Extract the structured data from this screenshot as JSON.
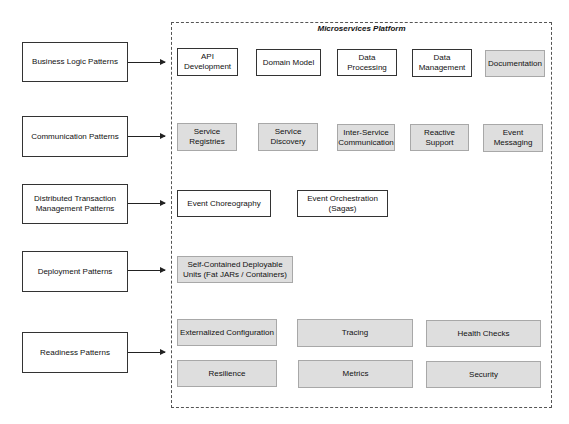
{
  "platform": {
    "title": "Microservices Platform"
  },
  "categories": [
    {
      "label": "Business Logic Patterns"
    },
    {
      "label": "Communication Patterns"
    },
    {
      "label": "Distributed Transaction\nManagement Patterns"
    },
    {
      "label": "Deployment Patterns"
    },
    {
      "label": "Readiness Patterns"
    }
  ],
  "business_logic": [
    {
      "label": "API\nDevelopment",
      "style": "white"
    },
    {
      "label": "Domain Model",
      "style": "white"
    },
    {
      "label": "Data\nProcessing",
      "style": "white"
    },
    {
      "label": "Data\nManagement",
      "style": "white"
    },
    {
      "label": "Documentation",
      "style": "gray"
    }
  ],
  "communication": [
    {
      "label": "Service\nRegistries",
      "style": "gray"
    },
    {
      "label": "Service\nDiscovery",
      "style": "gray"
    },
    {
      "label": "Inter-Service\nCommunication",
      "style": "gray"
    },
    {
      "label": "Reactive\nSupport",
      "style": "gray"
    },
    {
      "label": "Event\nMessaging",
      "style": "gray"
    }
  ],
  "distributed_transaction": [
    {
      "label": "Event Choreography",
      "style": "white"
    },
    {
      "label": "Event Orchestration\n(Sagas)",
      "style": "white"
    }
  ],
  "deployment": [
    {
      "label": "Self-Contained Deployable\nUnits (Fat JARs / Containers)",
      "style": "gray"
    }
  ],
  "readiness": [
    {
      "label": "Externalized Configuration",
      "style": "gray"
    },
    {
      "label": "Tracing",
      "style": "gray"
    },
    {
      "label": "Health Checks",
      "style": "gray"
    },
    {
      "label": "Resilience",
      "style": "gray"
    },
    {
      "label": "Metrics",
      "style": "gray"
    },
    {
      "label": "Security",
      "style": "gray"
    }
  ]
}
